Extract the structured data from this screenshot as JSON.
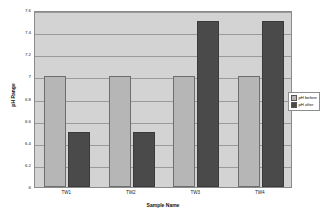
{
  "chart_data": {
    "type": "bar",
    "title": "",
    "xlabel": "Sample Name",
    "ylabel": "pH Range",
    "categories": [
      "TW1",
      "TW2",
      "TW3",
      "TW4"
    ],
    "series": [
      {
        "name": "pH before",
        "color": "#b6b6b6",
        "values": [
          7,
          7,
          7,
          7
        ]
      },
      {
        "name": "pH after",
        "color": "#4a4a4a",
        "values": [
          6.5,
          6.5,
          7.5,
          7.5
        ]
      }
    ],
    "ylim": [
      6,
      7.6
    ],
    "yticks": [
      "6",
      "6.2",
      "6.4",
      "6.6",
      "6.8",
      "7",
      "7.2",
      "7.4",
      "7.6"
    ],
    "ytick_values": [
      6,
      6.2,
      6.4,
      6.6,
      6.8,
      7,
      7.2,
      7.4,
      7.6
    ],
    "grid": true,
    "legend_position": "right",
    "plot_background": "#d3d3d3"
  }
}
